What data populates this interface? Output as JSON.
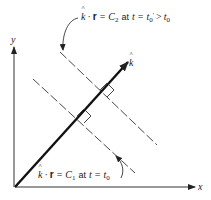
{
  "diagram": {
    "axes": {
      "x_label": "x",
      "y_label": "y"
    },
    "vector": {
      "label": "k",
      "hat": "^"
    },
    "planes": [
      {
        "id": "upper",
        "label_k": "k",
        "label_dot": "·",
        "label_r": "r",
        "label_eq": "=",
        "label_C": "C",
        "label_C_sub": "2",
        "label_at": "at",
        "label_t": "t",
        "label_eq2": "=",
        "label_t0": "t",
        "label_t0_sub": "0",
        "label_prime": "'",
        "label_gt": ">",
        "label_t0b": "t",
        "label_t0b_sub": "0"
      },
      {
        "id": "lower",
        "label_k": "k",
        "label_dot": "·",
        "label_r": "r",
        "label_eq": "=",
        "label_C": "C",
        "label_C_sub": "1",
        "label_at": "at",
        "label_t": "t",
        "label_eq2": "=",
        "label_t0": "t",
        "label_t0_sub": "0"
      }
    ],
    "colors": {
      "ink": "#222222",
      "background": "#ffffff"
    }
  }
}
